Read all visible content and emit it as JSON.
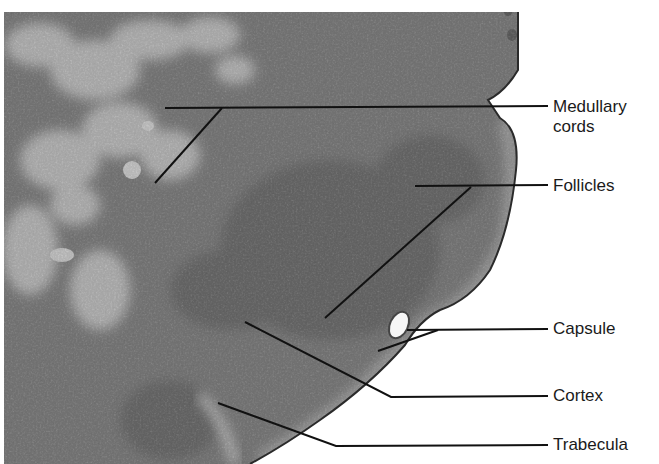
{
  "figure": {
    "colors": {
      "tissue_dark": "#3e3e3e",
      "tissue_mid": "#6a6a6a",
      "tissue_light": "#d8d8d8",
      "background": "#ffffff",
      "leader_line": "#111111"
    }
  },
  "labels": [
    {
      "id": "medullary-cords",
      "line1": "Medullary",
      "line2": "cords",
      "top": 97
    },
    {
      "id": "follicles",
      "line1": "Follicles",
      "top": 176
    },
    {
      "id": "capsule",
      "line1": "Capsule",
      "top": 319
    },
    {
      "id": "cortex",
      "line1": "Cortex",
      "top": 386
    },
    {
      "id": "trabecula",
      "line1": "Trabecula",
      "top": 435
    }
  ]
}
